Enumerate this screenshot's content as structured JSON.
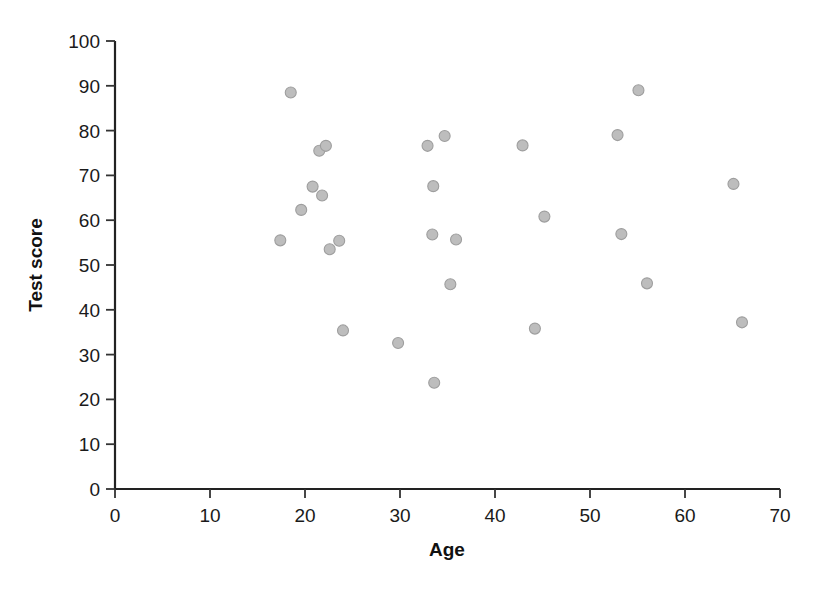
{
  "chart_data": {
    "type": "scatter",
    "title": "",
    "xlabel": "Age",
    "ylabel": "Test score",
    "xlim": [
      0,
      70
    ],
    "ylim": [
      0,
      100
    ],
    "xticks": [
      0,
      10,
      20,
      30,
      40,
      50,
      60,
      70
    ],
    "yticks": [
      0,
      10,
      20,
      30,
      40,
      50,
      60,
      70,
      80,
      90,
      100
    ],
    "grid": false,
    "legend": null,
    "marker": {
      "shape": "circle",
      "fill_color": "#bdbdbd",
      "edge_color": "#9e9e9e",
      "size_px": 11
    },
    "series": [
      {
        "name": "observations",
        "points": [
          {
            "x": 17.4,
            "y": 55.5
          },
          {
            "x": 18.5,
            "y": 88.5
          },
          {
            "x": 19.6,
            "y": 62.3
          },
          {
            "x": 20.8,
            "y": 67.5
          },
          {
            "x": 21.5,
            "y": 75.5
          },
          {
            "x": 21.8,
            "y": 65.5
          },
          {
            "x": 22.2,
            "y": 76.6
          },
          {
            "x": 22.6,
            "y": 53.5
          },
          {
            "x": 23.6,
            "y": 55.4
          },
          {
            "x": 24.0,
            "y": 35.4
          },
          {
            "x": 29.8,
            "y": 32.6
          },
          {
            "x": 32.9,
            "y": 76.6
          },
          {
            "x": 33.4,
            "y": 56.8
          },
          {
            "x": 33.5,
            "y": 67.6
          },
          {
            "x": 33.6,
            "y": 23.7
          },
          {
            "x": 34.7,
            "y": 78.8
          },
          {
            "x": 35.3,
            "y": 45.7
          },
          {
            "x": 35.9,
            "y": 55.7
          },
          {
            "x": 42.9,
            "y": 76.7
          },
          {
            "x": 44.2,
            "y": 35.8
          },
          {
            "x": 45.2,
            "y": 60.8
          },
          {
            "x": 52.9,
            "y": 79.0
          },
          {
            "x": 53.3,
            "y": 56.9
          },
          {
            "x": 55.1,
            "y": 89.0
          },
          {
            "x": 56.0,
            "y": 45.9
          },
          {
            "x": 65.1,
            "y": 68.1
          },
          {
            "x": 66.0,
            "y": 37.2
          }
        ]
      }
    ]
  },
  "axes": {
    "x_tick_labels": [
      "0",
      "10",
      "20",
      "30",
      "40",
      "50",
      "60",
      "70"
    ],
    "y_tick_labels": [
      "0",
      "10",
      "20",
      "30",
      "40",
      "50",
      "60",
      "70",
      "80",
      "90",
      "100"
    ],
    "x_axis_title": "Age",
    "y_axis_title": "Test score"
  }
}
